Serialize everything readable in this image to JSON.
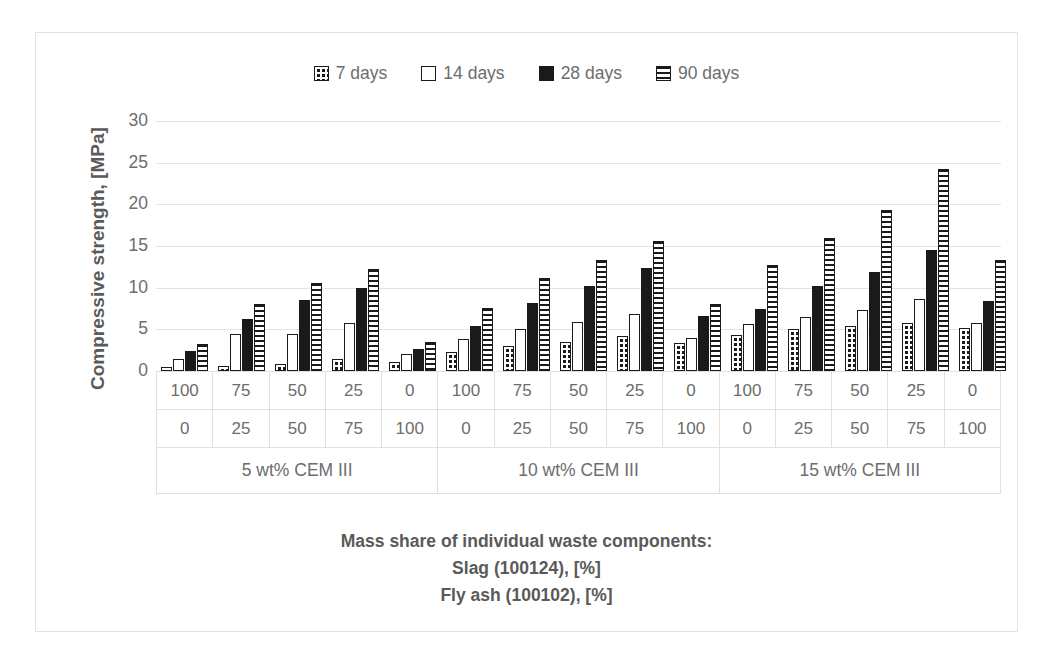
{
  "chart_data": {
    "type": "bar",
    "title": "",
    "xlabel": "Mass share of individual waste components: Slag (100124), [%] / Fly ash (100102), [%]",
    "ylabel": "Compressive strength, [MPa]",
    "ylim": [
      0,
      30
    ],
    "ytick_values": [
      30,
      25,
      20,
      15,
      10,
      5,
      0
    ],
    "grid": true,
    "legend_position": "top-center",
    "categories": [
      "100/0",
      "75/25",
      "50/50",
      "25/75",
      "0/100",
      "100/0",
      "75/25",
      "50/50",
      "25/75",
      "0/100",
      "100/0",
      "75/25",
      "50/50",
      "25/75",
      "0/100"
    ],
    "group_labels": [
      "5 wt% CEM III",
      "10 wt% CEM III",
      "15 wt% CEM III"
    ],
    "series": [
      {
        "name": "7 days",
        "pattern": "pat-dots",
        "values": [
          0.5,
          0.6,
          0.9,
          1.4,
          1.1,
          2.3,
          3.0,
          3.5,
          4.2,
          3.4,
          4.3,
          5.0,
          5.4,
          5.8,
          5.2
        ]
      },
      {
        "name": "14 days",
        "pattern": "pat-white",
        "values": [
          1.5,
          4.4,
          4.5,
          5.8,
          2.0,
          3.8,
          5.1,
          5.9,
          6.8,
          4.0,
          5.7,
          6.5,
          7.3,
          8.7,
          5.8
        ]
      },
      {
        "name": "28 days",
        "pattern": "pat-solid",
        "values": [
          2.4,
          6.3,
          8.5,
          10.0,
          2.6,
          5.4,
          8.2,
          10.2,
          12.4,
          6.6,
          7.4,
          10.2,
          11.9,
          14.5,
          8.4
        ]
      },
      {
        "name": "90 days",
        "pattern": "pat-hlines",
        "values": [
          3.2,
          8.0,
          10.6,
          12.2,
          3.5,
          7.6,
          11.2,
          13.3,
          15.6,
          8.1,
          12.7,
          16.0,
          19.3,
          24.2,
          13.3
        ]
      }
    ],
    "table_rows": [
      {
        "name": "slag-row",
        "values": [
          "100",
          "75",
          "50",
          "25",
          "0",
          "100",
          "75",
          "50",
          "25",
          "0",
          "100",
          "75",
          "50",
          "25",
          "0"
        ]
      },
      {
        "name": "fly-ash-row",
        "values": [
          "0",
          "25",
          "50",
          "75",
          "100",
          "0",
          "25",
          "50",
          "75",
          "100",
          "0",
          "25",
          "50",
          "75",
          "100"
        ]
      }
    ]
  },
  "legend": {
    "items": [
      {
        "label": "7 days",
        "pattern": "pat-dots"
      },
      {
        "label": "14 days",
        "pattern": "pat-white"
      },
      {
        "label": "28 days",
        "pattern": "pat-solid"
      },
      {
        "label": "90 days",
        "pattern": "pat-hlines"
      }
    ]
  },
  "axis": {
    "y_title": "Compressive strength, [MPa]"
  },
  "caption": {
    "line1": "Mass share of individual waste components:",
    "line2": "Slag (100124),   [%]",
    "line3": "Fly ash (100102),   [%]"
  },
  "colors": {
    "ink": "#1a1a1a",
    "text": "#6d6d6d",
    "bold_text": "#5a5a5a",
    "grid": "#e3e3e3",
    "frame": "#e2e2e2"
  }
}
